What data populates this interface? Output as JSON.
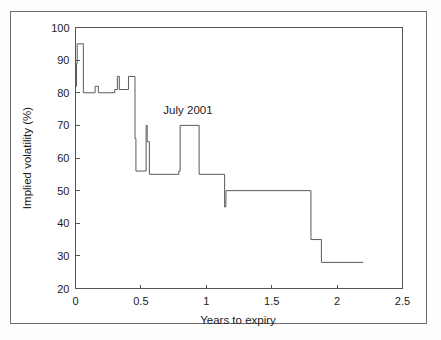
{
  "figure": {
    "frame_color": "#6e6e6e",
    "background_color": "#ffffff",
    "line_color": "#5a5a5a"
  },
  "chart_data": {
    "type": "line",
    "title": "",
    "subtitle": "",
    "xlabel": "Years to expiry",
    "ylabel": "Implied volatility (%)",
    "xlim": [
      0,
      2.5
    ],
    "ylim": [
      20,
      100
    ],
    "xticks": [
      0,
      0.5,
      1,
      1.5,
      2,
      2.5
    ],
    "xticklabels": [
      "0",
      "0.5",
      "1",
      "1.5",
      "2",
      "2.5"
    ],
    "yticks": [
      20,
      30,
      40,
      50,
      60,
      70,
      80,
      90,
      100
    ],
    "yticklabels": [
      "20",
      "30",
      "40",
      "50",
      "60",
      "70",
      "80",
      "90",
      "100"
    ],
    "grid": false,
    "legend": null,
    "legend_position": "none",
    "annotations": [
      {
        "text": "July 2001",
        "x": 0.86,
        "y": 73.5
      }
    ],
    "series": [
      {
        "name": "Implied volatility term structure",
        "style": "step",
        "x": [
          0.0,
          0.01,
          0.02,
          0.03,
          0.04,
          0.05,
          0.06,
          0.07,
          0.09,
          0.15,
          0.17,
          0.19,
          0.3,
          0.32,
          0.34,
          0.37,
          0.4,
          0.45,
          0.46,
          0.47,
          0.54,
          0.55,
          0.56,
          0.57,
          0.58,
          0.6,
          0.79,
          0.8,
          0.95,
          0.96,
          1.14,
          1.15,
          1.16,
          1.8,
          1.81,
          1.88,
          1.89,
          2.2
        ],
        "y": [
          82.0,
          82.0,
          95.0,
          95.0,
          95.0,
          95.0,
          80.0,
          80.0,
          80.0,
          80.0,
          82.0,
          80.0,
          80.0,
          85.0,
          81.0,
          81.0,
          85.0,
          85.0,
          66.0,
          56.0,
          56.0,
          70.0,
          65.0,
          65.0,
          55.0,
          55.0,
          55.0,
          56.0,
          70.0,
          70.0,
          55.0,
          45.0,
          50.0,
          50.0,
          35.0,
          35.0,
          28.0,
          28.0
        ],
        "vertices": [
          [
            0.0,
            82.0
          ],
          [
            0.008,
            82.0
          ],
          [
            0.008,
            89.0
          ],
          [
            0.013,
            89.0
          ],
          [
            0.013,
            95.0
          ],
          [
            0.06,
            95.0
          ],
          [
            0.06,
            80.0
          ],
          [
            0.15,
            80.0
          ],
          [
            0.15,
            82.0
          ],
          [
            0.175,
            82.0
          ],
          [
            0.175,
            80.0
          ],
          [
            0.3,
            80.0
          ],
          [
            0.3,
            81.0
          ],
          [
            0.32,
            81.0
          ],
          [
            0.32,
            85.0
          ],
          [
            0.335,
            85.0
          ],
          [
            0.335,
            81.0
          ],
          [
            0.405,
            81.0
          ],
          [
            0.405,
            85.0
          ],
          [
            0.455,
            85.0
          ],
          [
            0.455,
            66.0
          ],
          [
            0.462,
            66.0
          ],
          [
            0.462,
            56.0
          ],
          [
            0.54,
            56.0
          ],
          [
            0.54,
            70.0
          ],
          [
            0.548,
            70.0
          ],
          [
            0.548,
            65.0
          ],
          [
            0.565,
            65.0
          ],
          [
            0.565,
            55.0
          ],
          [
            0.79,
            55.0
          ],
          [
            0.79,
            56.0
          ],
          [
            0.8,
            56.0
          ],
          [
            0.8,
            70.0
          ],
          [
            0.945,
            70.0
          ],
          [
            0.945,
            55.0
          ],
          [
            1.14,
            55.0
          ],
          [
            1.14,
            45.0
          ],
          [
            1.15,
            45.0
          ],
          [
            1.15,
            50.0
          ],
          [
            1.8,
            50.0
          ],
          [
            1.8,
            35.0
          ],
          [
            1.88,
            35.0
          ],
          [
            1.88,
            28.0
          ],
          [
            2.2,
            28.0
          ]
        ]
      }
    ]
  },
  "labels": {
    "ylabel_text": "Implied volatility (%)",
    "xlabel_text": "Years to expiry",
    "annotation_text": "July 2001"
  }
}
